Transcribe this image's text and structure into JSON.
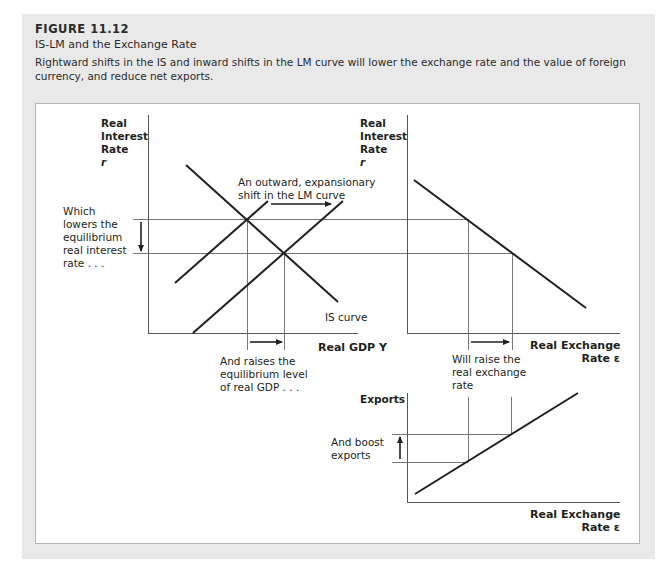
{
  "figure": {
    "number": "FIGURE 11.12",
    "title": "IS-LM and the Exchange Rate",
    "caption": "Rightward shifts in the IS and inward shifts in the LM curve will lower the exchange rate and the value of foreign currency, and reduce net exports."
  },
  "panels": {
    "islm": {
      "y_axis_label": [
        "Real",
        "Interest",
        "Rate",
        "r"
      ],
      "x_axis_label": "Real GDP Y",
      "curves": [
        "IS curve",
        "LM curve (initial)",
        "LM curve (shifted outward)"
      ],
      "annotations": {
        "lm_shift": [
          "An outward, expansionary",
          "shift in the LM curve"
        ],
        "rate_fall": [
          "Which",
          "lowers the",
          "equilibrium",
          "real interest",
          "rate . . ."
        ],
        "gdp_rise": [
          "And raises the",
          "equilibrium level",
          "of real GDP . . ."
        ],
        "is_label": "IS curve"
      }
    },
    "exchange": {
      "y_axis_label": [
        "Real",
        "Interest",
        "Rate",
        "r"
      ],
      "x_axis_label": [
        "Real Exchange",
        "Rate ε"
      ],
      "annotations": {
        "exchange_rise": [
          "Will raise the",
          "real exchange",
          "rate"
        ]
      }
    },
    "exports": {
      "y_axis_label": "Exports",
      "x_axis_label": [
        "Real Exchange",
        "Rate ε"
      ],
      "annotations": {
        "exports_rise": [
          "And boost",
          "exports"
        ]
      }
    }
  },
  "colors": {
    "outer_background": "#e9e9e9",
    "panel_background": "#ffffff",
    "line": "#231f20",
    "guide_line": "#555555"
  }
}
